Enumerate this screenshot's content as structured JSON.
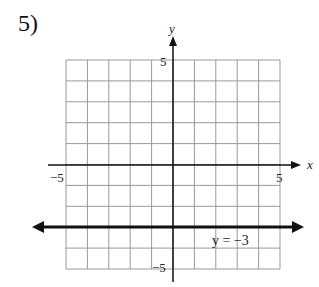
{
  "problem_number": "5)",
  "chart_data": {
    "type": "line",
    "title": "",
    "xlabel": "x",
    "ylabel": "y",
    "xlim": [
      -5,
      5
    ],
    "ylim": [
      -5,
      5
    ],
    "grid": true,
    "tick_labels": {
      "x": [
        "-5",
        "5"
      ],
      "y": [
        "5",
        "-5"
      ]
    },
    "series": [
      {
        "name": "y = -3",
        "equation": "y = -3",
        "x": [
          -5.5,
          5.5
        ],
        "y": [
          -3,
          -3
        ],
        "arrows": "both"
      }
    ],
    "annotations": [
      {
        "text": "y = -3",
        "x": 3,
        "y": -3.6
      }
    ]
  },
  "labels": {
    "x_axis": "x",
    "y_axis": "y",
    "x_min": "−5",
    "x_max": "5",
    "y_max": "5",
    "y_min": "−5",
    "line_label": "y = −3"
  }
}
